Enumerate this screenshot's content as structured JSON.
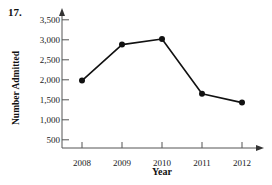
{
  "problem": {
    "number": "17."
  },
  "chart_data": {
    "type": "line",
    "title": "",
    "xlabel": "Year",
    "ylabel": "Number Admitted",
    "categories": [
      "2008",
      "2009",
      "2010",
      "2011",
      "2012"
    ],
    "values": [
      1980,
      2880,
      3020,
      1650,
      1430
    ],
    "series": [
      {
        "name": "Number Admitted",
        "values": [
          1980,
          2880,
          3020,
          1650,
          1430
        ]
      }
    ],
    "x": [
      2008,
      2009,
      2010,
      2011,
      2012
    ],
    "ytick_labels": [
      "500",
      "1,000",
      "1,500",
      "2,000",
      "2,500",
      "3,000",
      "3,500"
    ],
    "ytick_values": [
      500,
      1000,
      1500,
      2000,
      2500,
      3000,
      3500
    ],
    "xtick_labels": [
      "2008",
      "2009",
      "2010",
      "2011",
      "2012"
    ],
    "ylim": [
      0,
      3800
    ],
    "xlim": [
      2007.5,
      2012.5
    ],
    "grid": false,
    "legend": false,
    "marker": "filled-circle",
    "line_color": "#111111",
    "marker_color": "#111111",
    "axis_color": "#555555"
  }
}
